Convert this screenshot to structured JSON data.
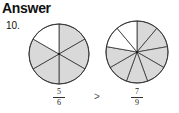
{
  "heading": "Answer",
  "problem_number": "10.",
  "left_circle": {
    "parts": 6,
    "shaded": 5,
    "numerator": "5",
    "denominator": "6",
    "shade_color": "#d9d9d9"
  },
  "comparison": ">",
  "right_circle": {
    "parts": 9,
    "shaded": 7,
    "numerator": "7",
    "denominator": "9",
    "shade_color": "#d9d9d9"
  }
}
